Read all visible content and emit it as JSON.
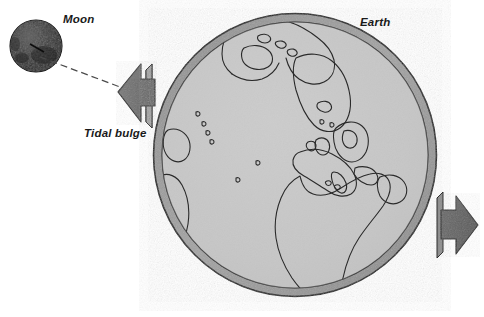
{
  "figure": {
    "title_visible": false,
    "background_color": "#ffffff",
    "width": 484,
    "height": 317
  },
  "labels": {
    "moon": "Moon",
    "earth": "Earth",
    "tidal_bulge": "Tidal bulge"
  },
  "colors": {
    "moon_fill": "#2d2d2d",
    "moon_highlight": "#585858",
    "arrow_fill": "#6e6e6e",
    "arrow_side_fill": "#8c8c8c",
    "arrow_outline": "#2b2b2b",
    "earth_ring_fill": "#9c9c9c",
    "earth_interior_fill": "#c9c9c9",
    "outline": "#1f1f1f",
    "coastline": "#2a2a2a",
    "connector_line": "#4a4a4a",
    "label_text": "#1a1a1a"
  },
  "objects": {
    "moon": {
      "name": "Moon",
      "shape": "circle",
      "center_x": 36,
      "center_y": 46,
      "radius": 26,
      "surface": "cratered dark grey"
    },
    "earth": {
      "name": "Earth",
      "shape": "circle",
      "center_x": 295,
      "center_y": 155,
      "radius": 142,
      "ring_thickness": 9,
      "ring_note": "darker grey ocean shell / tidal envelope",
      "continents_visible": [
        "Greenland",
        "Canadian Arctic",
        "Europe",
        "Scandinavia",
        "British Isles",
        "Africa",
        "Arabia",
        "Mediterranean Sea",
        "Atlantic Ocean"
      ]
    },
    "tidal_bulge_left": {
      "name": "Tidal bulge arrow (moon-facing)",
      "direction": "left",
      "tip_x": 118,
      "tip_y": 92
    },
    "tidal_bulge_right": {
      "name": "Tidal bulge arrow (anti-moon)",
      "direction": "right",
      "tip_x": 478,
      "tip_y": 225
    },
    "connector": {
      "name": "Moon-to-bulge sight line",
      "style": "dashed",
      "from_x": 40,
      "from_y": 57,
      "to_x": 120,
      "to_y": 87
    }
  }
}
